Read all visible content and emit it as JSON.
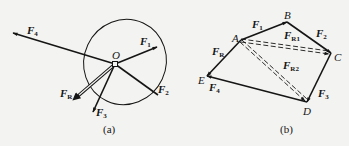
{
  "figure_a": {
    "caption": "(a)",
    "origin_label": "O",
    "forces": [
      {
        "name": "F",
        "sub": "1"
      },
      {
        "name": "F",
        "sub": "2"
      },
      {
        "name": "F",
        "sub": "3"
      },
      {
        "name": "F",
        "sub": "4"
      },
      {
        "name": "F",
        "sub": "R"
      }
    ]
  },
  "figure_b": {
    "caption": "(b)",
    "points": [
      "A",
      "B",
      "C",
      "D",
      "E"
    ],
    "forces": [
      {
        "name": "F",
        "sub": "1"
      },
      {
        "name": "F",
        "sub": "2"
      },
      {
        "name": "F",
        "sub": "3"
      },
      {
        "name": "F",
        "sub": "4"
      },
      {
        "name": "F",
        "sub": "R"
      },
      {
        "name": "F",
        "sub": "R1"
      },
      {
        "name": "F",
        "sub": "R2"
      }
    ]
  },
  "colors": {
    "ink": "#151515",
    "background": "#f3f3f1"
  }
}
